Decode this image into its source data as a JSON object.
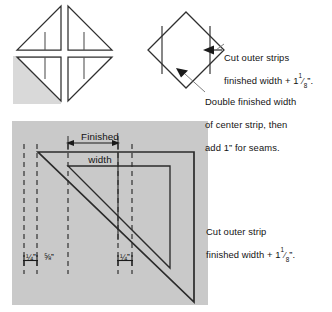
{
  "figure": {
    "title_hidden": "",
    "colors": {
      "page_background": "#ffffff",
      "panel_fill": "#c9c9c9",
      "highlight_fill": "#d8d8d8",
      "line_dark": "#2b2b2b",
      "line_mid": "#555555",
      "leader_line": "#6e6e6e",
      "text": "#131313"
    }
  },
  "top_left_block": {
    "name": "pinwheel-block",
    "description": "Four half-square triangle units arranged in a pinwheel",
    "units": [
      {
        "id": "unit-top-left",
        "shaded": false
      },
      {
        "id": "unit-top-right",
        "shaded": false
      },
      {
        "id": "unit-bottom-left",
        "shaded": true
      },
      {
        "id": "unit-bottom-right",
        "shaded": false
      }
    ]
  },
  "diamond_diagram": {
    "name": "square-on-point-diagram",
    "description": "Square on point with two vertical strip seam lines",
    "arrows": [
      {
        "id": "arrow-outer-strip",
        "points_to": "right outer strip"
      },
      {
        "id": "arrow-center-strip",
        "points_to": "center strip"
      }
    ]
  },
  "callouts": {
    "outer_strips": {
      "line1": "Cut outer strips",
      "line2_prefix": "finished width + 1",
      "line2_fraction_num": "1",
      "line2_fraction_den": "8",
      "line2_suffix": "”."
    },
    "center_strip": {
      "line1": "Double finished width",
      "line2": "of center strip, then",
      "line3": "add 1” for seams."
    },
    "cut_outer_strip": {
      "line1": "Cut outer strip",
      "line2_prefix": "finished width + 1",
      "line2_fraction_num": "1",
      "line2_fraction_den": "8",
      "line2_suffix": "”."
    }
  },
  "main_diagram": {
    "name": "triangle-cutting-diagram",
    "finished_width_label_line1": "Finished",
    "finished_width_label_line2": "width",
    "measurements": [
      {
        "id": "measure-seam-left",
        "value": "1",
        "den": "4",
        "unit": "”",
        "display": "¼”"
      },
      {
        "id": "measure-middle",
        "value": "5",
        "den": "8",
        "unit": "”",
        "display": "⅝”"
      },
      {
        "id": "measure-seam-right",
        "value": "1",
        "den": "4",
        "unit": "”",
        "display": "¼”"
      }
    ],
    "dashed_guide_line_count": 6,
    "shapes": [
      {
        "id": "outer-triangle",
        "type": "right-triangle"
      },
      {
        "id": "inner-triangle",
        "type": "right-triangle"
      }
    ]
  }
}
